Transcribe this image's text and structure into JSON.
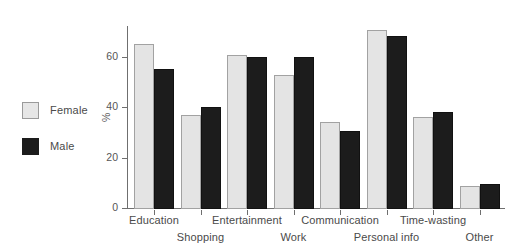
{
  "chart_data": {
    "type": "bar",
    "title": "",
    "subtitle": "",
    "xlabel": "",
    "ylabel": "%",
    "ylim": [
      0,
      75
    ],
    "yticks": [
      0,
      20,
      40,
      60
    ],
    "ytick_labels": [
      "0",
      "20",
      "40",
      "60"
    ],
    "grid": false,
    "legend_position": "left",
    "categories": [
      "Education",
      "Shopping",
      "Entertainment",
      "Work",
      "Communication",
      "Personal info",
      "Time-wasting",
      "Other"
    ],
    "series": [
      {
        "name": "Female",
        "color": "#e4e4e4",
        "values": [
          65.5,
          37.5,
          61,
          53,
          34.5,
          71,
          36.5,
          9
        ]
      },
      {
        "name": "Male",
        "color": "#1c1c1c",
        "values": [
          55.5,
          40.5,
          60.5,
          60.5,
          31,
          68.5,
          38.5,
          9.8
        ]
      }
    ]
  },
  "legend": {
    "items": [
      {
        "label": "Female",
        "swatch": "female-swatch"
      },
      {
        "label": "Male",
        "swatch": "male-swatch"
      }
    ]
  },
  "axis": {
    "y_title": "%",
    "tick_labels": [
      "60",
      "40",
      "20",
      "0"
    ]
  },
  "colors": {
    "female": "#e4e4e4",
    "female_border": "#a2a2a2",
    "male": "#1c1c1c",
    "axis": "#6f6f6f",
    "text": "#4a4a4a",
    "background": "#ffffff"
  }
}
